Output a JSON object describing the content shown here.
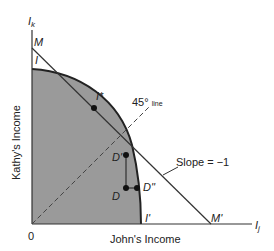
{
  "diagram": {
    "y_axis_label": "Kathy's Income",
    "x_axis_label": "John's Income",
    "y_axis_symbol": "I",
    "y_axis_sub": "k",
    "x_axis_symbol": "I",
    "x_axis_sub": "j",
    "origin": "0",
    "points": {
      "M": "M",
      "I": "I",
      "I_star": "I*",
      "D_prime": "D'",
      "D": "D",
      "D_dprime": "D''",
      "I_prime": "I'",
      "M_prime": "M'"
    },
    "line_45": "45°",
    "line_45_suffix": "line",
    "slope_label": "Slope = −1",
    "colors": {
      "fill": "#9a9a9a",
      "stroke": "#222222"
    }
  }
}
